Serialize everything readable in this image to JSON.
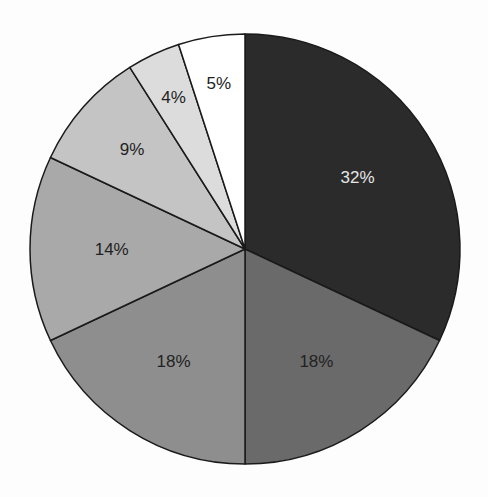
{
  "chart_data": {
    "type": "pie",
    "title": "",
    "start_angle_deg": 0,
    "direction": "clockwise",
    "categories": [
      "Slice 1",
      "Slice 2",
      "Slice 3",
      "Slice 4",
      "Slice 5",
      "Slice 6",
      "Slice 7"
    ],
    "values": [
      32,
      18,
      18,
      14,
      9,
      4,
      5
    ],
    "labels": [
      "32%",
      "18%",
      "18%",
      "14%",
      "9%",
      "4%",
      "5%"
    ],
    "colors": [
      "#2b2b2b",
      "#6a6a6a",
      "#8e8e8e",
      "#a9a9a9",
      "#c4c4c4",
      "#dcdcdc",
      "#ffffff"
    ],
    "label_colors": [
      "#e6e6e6",
      "#222222",
      "#222222",
      "#222222",
      "#222222",
      "#222222",
      "#222222"
    ],
    "legend": null,
    "geometry": {
      "cx": 245,
      "cy": 249,
      "r": 215
    }
  }
}
